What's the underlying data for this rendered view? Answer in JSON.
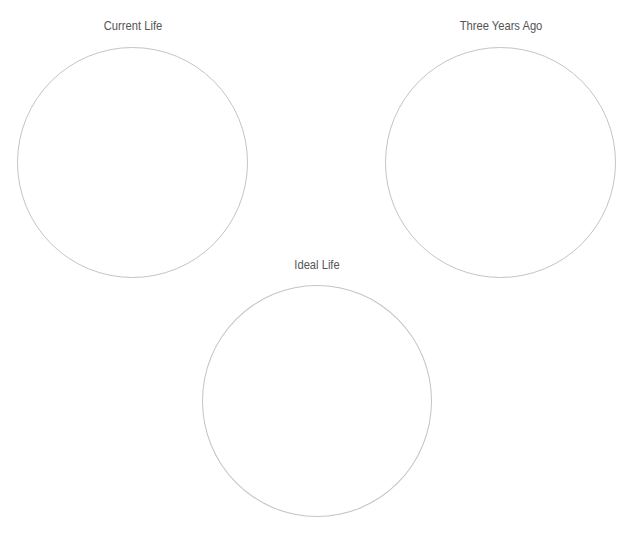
{
  "diagram": {
    "type": "three-circle-comparison",
    "stroke_color": "#c4c4c4",
    "label_color": "#555555",
    "circles": [
      {
        "id": "current-life",
        "label": "Current Life"
      },
      {
        "id": "three-years-ago",
        "label": "Three Years Ago"
      },
      {
        "id": "ideal-life",
        "label": "Ideal Life"
      }
    ]
  }
}
